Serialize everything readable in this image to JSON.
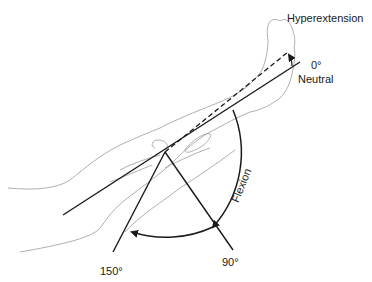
{
  "diagram": {
    "labels": {
      "hyperextension": "Hyperextension",
      "neutral_angle": "0°",
      "neutral": "Neutral",
      "flexion": "Flexion",
      "angle_90": "90°",
      "angle_150": "150°"
    },
    "colors": {
      "line": "#1a1a1a",
      "outline": "#9a9a9a",
      "background": "#ffffff"
    }
  }
}
